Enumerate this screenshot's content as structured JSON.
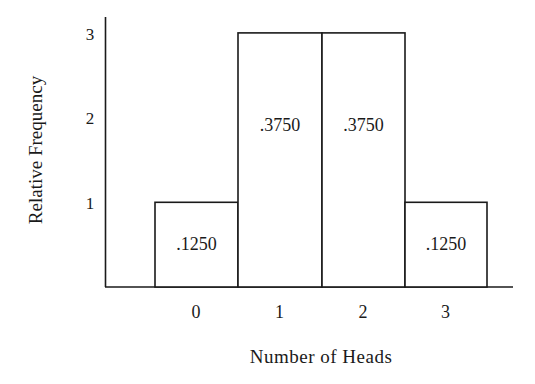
{
  "chart_data": {
    "type": "bar",
    "title": "",
    "xlabel": "Number of Heads",
    "ylabel": "Relative Frequency",
    "categories": [
      "0",
      "1",
      "2",
      "3"
    ],
    "values": [
      1,
      3,
      3,
      1
    ],
    "bar_labels": [
      ".1250",
      ".3750",
      ".3750",
      ".1250"
    ],
    "yticks": [
      "1",
      "2",
      "3"
    ],
    "ylim": [
      0,
      3
    ],
    "grid": false,
    "legend": null
  }
}
